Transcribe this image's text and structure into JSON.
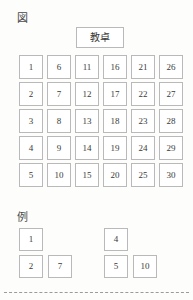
{
  "figure": {
    "caption": "図",
    "teacher_desk_label": "教卓",
    "seat_grid": {
      "columns": 6,
      "rows": 5,
      "order": "column-major",
      "seats": [
        "1",
        "6",
        "11",
        "16",
        "21",
        "26",
        "2",
        "7",
        "12",
        "17",
        "22",
        "27",
        "3",
        "8",
        "13",
        "18",
        "23",
        "28",
        "4",
        "9",
        "14",
        "19",
        "24",
        "29",
        "5",
        "10",
        "15",
        "20",
        "25",
        "30"
      ]
    }
  },
  "example": {
    "caption": "例",
    "groups": [
      {
        "name": "example-group-a",
        "rows": [
          [
            "1"
          ],
          [
            "2",
            "7"
          ]
        ]
      },
      {
        "name": "example-group-b",
        "rows": [
          [
            "4"
          ],
          [
            "5",
            "10"
          ]
        ]
      }
    ]
  },
  "style": {
    "box_border_color": "#b9b9b9",
    "box_fill_color": "#ffffff",
    "text_color": "#3a3a3a",
    "page_background": "#fdfdfc",
    "divider_color": "#9b9b9b"
  }
}
